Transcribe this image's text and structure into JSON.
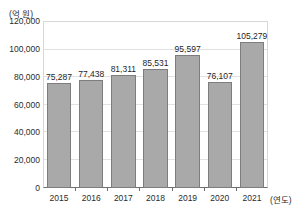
{
  "chart_data": {
    "type": "bar",
    "title": "",
    "xlabel": "(연도)",
    "ylabel": "(억 원)",
    "categories": [
      "2015",
      "2016",
      "2017",
      "2018",
      "2019",
      "2020",
      "2021"
    ],
    "values": [
      75287,
      77438,
      81311,
      85531,
      95597,
      76107,
      105279
    ],
    "value_labels": [
      "75,287",
      "77,438",
      "81,311",
      "85,531",
      "95,597",
      "76,107",
      "105,279"
    ],
    "ylim": [
      0,
      120000
    ],
    "ytick_values": [
      0,
      20000,
      40000,
      60000,
      80000,
      100000,
      120000
    ],
    "ytick_labels": [
      "0",
      "20,000",
      "40,000",
      "60,000",
      "80,000",
      "100,000",
      "120,000"
    ],
    "grid": true,
    "legend": false,
    "series": [
      {
        "name": "",
        "values": [
          75287,
          77438,
          81311,
          85531,
          95597,
          76107,
          105279
        ],
        "color": "#a9a9a9",
        "border_color": "#7d7d7d"
      }
    ],
    "colors": {
      "bar_fill": "#a9a9a9",
      "bar_border": "#7d7d7d",
      "gridline": "#e2e2e2",
      "axis": "#6e6e6e",
      "plot_border": "#d8d8d8",
      "text": "#2b2b2b"
    }
  }
}
